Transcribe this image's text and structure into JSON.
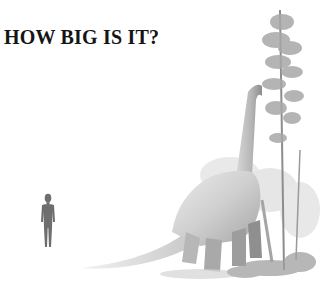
{
  "title": "HOW BIG IS IT?",
  "illustration": {
    "subjects": [
      "human-silhouette",
      "sauropod-dinosaur",
      "tall-conifer-tree",
      "ferns-and-shrubs"
    ],
    "colors": {
      "background": "#ffffff",
      "title": "#151515",
      "human": "#6e6e6e",
      "dino_light": "#e4e4e4",
      "dino_mid": "#bdbdbd",
      "dino_dark": "#8a8a8a",
      "foliage": "#9a9a9a"
    }
  }
}
